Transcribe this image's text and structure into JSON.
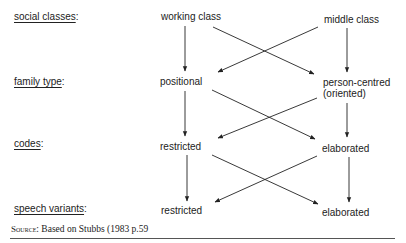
{
  "diagram": {
    "rows": [
      {
        "label": "social classes",
        "left": "working class",
        "right": "middle class"
      },
      {
        "label": "family type",
        "left": "positional",
        "right": "person-centred",
        "right_sub": "(oriented)"
      },
      {
        "label": "codes",
        "left": "restricted",
        "right": "elaborated"
      },
      {
        "label": "speech variants",
        "left": "restricted",
        "right": "elaborated"
      }
    ],
    "colon": ":",
    "edges": [
      {
        "from": "working class",
        "to": "positional"
      },
      {
        "from": "working class",
        "to": "person-centred"
      },
      {
        "from": "middle class",
        "to": "positional"
      },
      {
        "from": "middle class",
        "to": "person-centred"
      },
      {
        "from": "positional",
        "to": "restricted (codes)"
      },
      {
        "from": "positional",
        "to": "elaborated (codes)"
      },
      {
        "from": "person-centred",
        "to": "restricted (codes)"
      },
      {
        "from": "person-centred",
        "to": "elaborated (codes)"
      },
      {
        "from": "restricted (codes)",
        "to": "restricted (speech)"
      },
      {
        "from": "restricted (codes)",
        "to": "elaborated (speech)"
      },
      {
        "from": "elaborated (codes)",
        "to": "restricted (speech)"
      },
      {
        "from": "elaborated (codes)",
        "to": "elaborated (speech)"
      }
    ]
  },
  "source": {
    "prefix": "Source",
    "text": "Based on Stubbs (1983 p.59"
  }
}
